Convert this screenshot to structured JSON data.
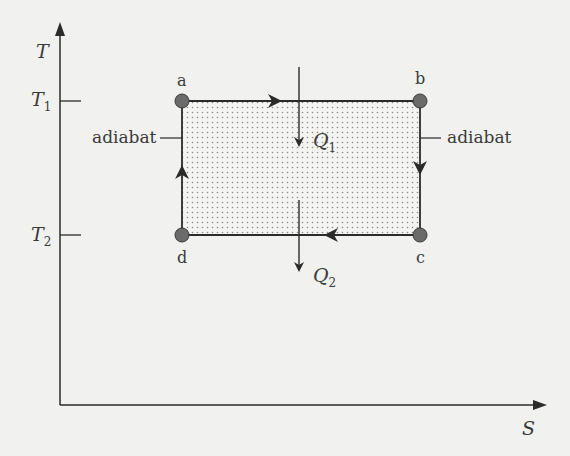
{
  "diagram": {
    "type": "T-S diagram (Carnot cycle)",
    "axes": {
      "y_label": "T",
      "x_label": "S",
      "y_ticks": [
        {
          "label_main": "T",
          "label_sub": "1"
        },
        {
          "label_main": "T",
          "label_sub": "2"
        }
      ]
    },
    "points": [
      {
        "id": "a",
        "label": "a"
      },
      {
        "id": "b",
        "label": "b"
      },
      {
        "id": "c",
        "label": "c"
      },
      {
        "id": "d",
        "label": "d"
      }
    ],
    "edges": [
      {
        "from": "a",
        "to": "b",
        "process": "isotherm T1"
      },
      {
        "from": "b",
        "to": "c",
        "process": "adiabat"
      },
      {
        "from": "c",
        "to": "d",
        "process": "isotherm T2"
      },
      {
        "from": "d",
        "to": "a",
        "process": "adiabat"
      }
    ],
    "annotations": {
      "adiabat_left": "adiabat",
      "adiabat_right": "adiabat",
      "heat_in": {
        "main": "Q",
        "sub": "1"
      },
      "heat_out": {
        "main": "Q",
        "sub": "2"
      }
    },
    "colors": {
      "ink": "#2b2b2b",
      "point_fill": "#6b6b6b",
      "background": "#f1f1ef",
      "fill_dots": "#8a8a8a"
    }
  }
}
